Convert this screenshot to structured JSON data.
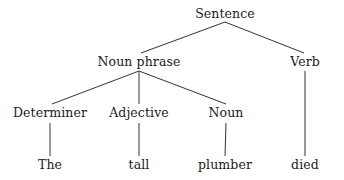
{
  "diagram": {
    "type": "syntax-tree",
    "sentence": "The tall plumber died",
    "background_color": "#ffffff",
    "line_color": "#333333",
    "text_color": "#1a1a1a",
    "nodes": [
      {
        "id": "sentence",
        "label": "Sentence",
        "level": 0,
        "x": 225,
        "y": 14
      },
      {
        "id": "noun-phrase",
        "label": "Noun phrase",
        "level": 1,
        "x": 139,
        "y": 62
      },
      {
        "id": "verb",
        "label": "Verb",
        "level": 1,
        "x": 305,
        "y": 62
      },
      {
        "id": "determiner",
        "label": "Determiner",
        "level": 2,
        "x": 50,
        "y": 113
      },
      {
        "id": "adjective",
        "label": "Adjective",
        "level": 2,
        "x": 139,
        "y": 113
      },
      {
        "id": "noun",
        "label": "Noun",
        "level": 2,
        "x": 226,
        "y": 113
      },
      {
        "id": "the",
        "label": "The",
        "level": 3,
        "x": 50,
        "y": 165
      },
      {
        "id": "tall",
        "label": "tall",
        "level": 3,
        "x": 139,
        "y": 165
      },
      {
        "id": "plumber",
        "label": "plumber",
        "level": 3,
        "x": 225,
        "y": 165
      },
      {
        "id": "died",
        "label": "died",
        "level": 3,
        "x": 305,
        "y": 165
      }
    ],
    "edges": [
      {
        "id": "edge-sentence-nounphrase",
        "from": "sentence",
        "to": "noun-phrase",
        "x1": 225,
        "y1": 22,
        "x2": 141,
        "y2": 53
      },
      {
        "id": "edge-sentence-verb",
        "from": "sentence",
        "to": "verb",
        "x1": 225,
        "y1": 22,
        "x2": 304,
        "y2": 53
      },
      {
        "id": "edge-nounphrase-det",
        "from": "noun-phrase",
        "to": "determiner",
        "x1": 139,
        "y1": 71,
        "x2": 52,
        "y2": 104
      },
      {
        "id": "edge-nounphrase-adj",
        "from": "noun-phrase",
        "to": "adjective",
        "x1": 139,
        "y1": 71,
        "x2": 139,
        "y2": 104
      },
      {
        "id": "edge-nounphrase-noun",
        "from": "noun-phrase",
        "to": "noun",
        "x1": 139,
        "y1": 71,
        "x2": 226,
        "y2": 104
      },
      {
        "id": "edge-verb-died",
        "from": "verb",
        "to": "died",
        "x1": 305,
        "y1": 71,
        "x2": 305,
        "y2": 156
      },
      {
        "id": "edge-det-the",
        "from": "determiner",
        "to": "the",
        "x1": 50,
        "y1": 123,
        "x2": 50,
        "y2": 156
      },
      {
        "id": "edge-adj-tall",
        "from": "adjective",
        "to": "tall",
        "x1": 139,
        "y1": 123,
        "x2": 139,
        "y2": 156
      },
      {
        "id": "edge-noun-plumber",
        "from": "noun",
        "to": "plumber",
        "x1": 226,
        "y1": 123,
        "x2": 225,
        "y2": 156
      }
    ]
  }
}
